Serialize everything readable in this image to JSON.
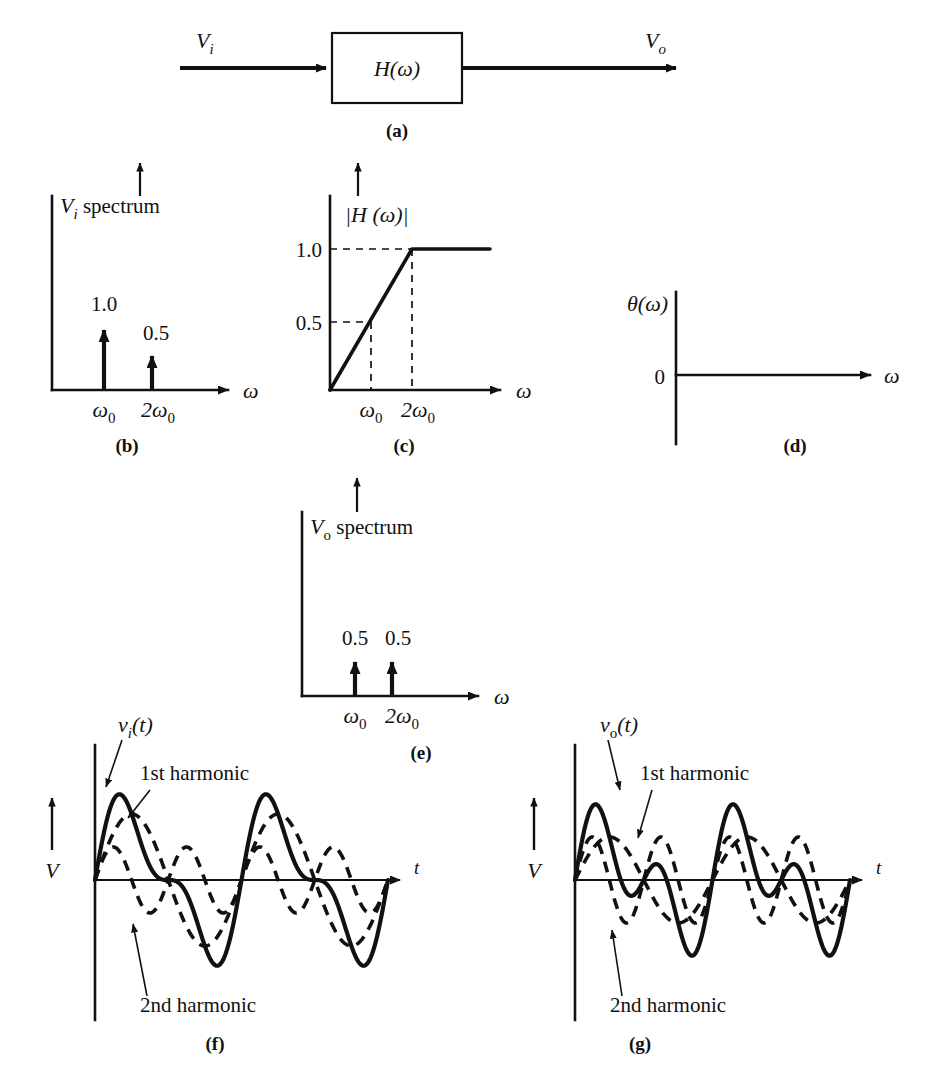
{
  "figure": {
    "panels": [
      {
        "id": "a",
        "label": "(a)",
        "caption": "block diagram"
      },
      {
        "id": "b",
        "label": "(b)",
        "caption": "input spectrum"
      },
      {
        "id": "c",
        "label": "(c)",
        "caption": "magnitude response"
      },
      {
        "id": "d",
        "label": "(d)",
        "caption": "phase response"
      },
      {
        "id": "e",
        "label": "(e)",
        "caption": "output spectrum"
      },
      {
        "id": "f",
        "label": "(f)",
        "caption": "input waveform"
      },
      {
        "id": "g",
        "label": "(g)",
        "caption": "output waveform"
      }
    ]
  },
  "panel_a": {
    "label": "(a)",
    "input_label": "V",
    "input_sub": "i",
    "output_label": "V",
    "output_sub": "o",
    "block_text": "H(ω)"
  },
  "panel_b": {
    "label": "(b)",
    "axis_title": "spectrum",
    "axis_title_var": "V",
    "axis_title_sub": "i",
    "x_axis_label": "ω",
    "tick_labels": [
      "ω",
      "2ω"
    ],
    "tick_sub": "0",
    "value_labels": [
      "1.0",
      "0.5"
    ],
    "chart_data": {
      "type": "bar",
      "title": "Vi spectrum",
      "categories": [
        "ω0",
        "2ω0"
      ],
      "values": [
        1.0,
        0.5
      ],
      "xlabel": "ω",
      "ylabel": "",
      "ylim": [
        0,
        1.25
      ],
      "grid": false,
      "legend": "none"
    }
  },
  "panel_c": {
    "label": "(c)",
    "axis_title": "|H (ω)|",
    "x_axis_label": "ω",
    "y_tick_labels": [
      "1.0",
      "0.5"
    ],
    "x_tick_labels": [
      "ω",
      "2ω"
    ],
    "x_tick_sub": "0",
    "chart_data": {
      "type": "line",
      "title": "|H (ω)|",
      "x": [
        0,
        1,
        2,
        4
      ],
      "y": [
        0.0,
        0.5,
        1.0,
        1.0
      ],
      "x_tick_values": [
        1,
        2
      ],
      "x_tick_labels": [
        "ω0",
        "2ω0"
      ],
      "y_tick_values": [
        0.5,
        1.0
      ],
      "y_tick_labels": [
        "0.5",
        "1.0"
      ],
      "xlabel": "ω",
      "ylabel": "",
      "ylim": [
        0,
        1.25
      ],
      "grid": false,
      "guides": "dashed",
      "legend": "none"
    }
  },
  "panel_d": {
    "label": "(d)",
    "axis_title": "θ(ω)",
    "zero_label": "0",
    "x_axis_label": "ω",
    "chart_data": {
      "type": "line",
      "title": "θ(ω)",
      "x": [
        0,
        4
      ],
      "y": [
        0,
        0
      ],
      "xlabel": "ω",
      "ylabel": "θ(ω)",
      "y_tick_values": [
        0
      ],
      "y_tick_labels": [
        "0"
      ],
      "grid": false,
      "legend": "none"
    }
  },
  "panel_e": {
    "label": "(e)",
    "axis_title": "spectrum",
    "axis_title_var": "V",
    "axis_title_sub": "o",
    "x_axis_label": "ω",
    "tick_labels": [
      "ω",
      "2ω"
    ],
    "tick_sub": "0",
    "value_labels": [
      "0.5",
      "0.5"
    ],
    "chart_data": {
      "type": "bar",
      "title": "Vo spectrum",
      "categories": [
        "ω0",
        "2ω0"
      ],
      "values": [
        0.5,
        0.5
      ],
      "xlabel": "ω",
      "ylabel": "",
      "ylim": [
        0,
        1.25
      ],
      "grid": false,
      "legend": "none"
    }
  },
  "panel_f": {
    "label": "(f)",
    "signal_label": "v",
    "signal_sub": "i",
    "signal_suffix": "(t)",
    "y_axis_label": "V",
    "x_axis_label": "t",
    "ann_first": "1st harmonic",
    "ann_second": "2nd harmonic",
    "chart_data": {
      "type": "line",
      "title": "vi(t)",
      "xlabel": "t",
      "ylabel": "V",
      "cycles": 2,
      "series": [
        {
          "name": "vi(t)",
          "style": "solid",
          "amplitude_1": 1.0,
          "amplitude_2": 0.5,
          "description": "sum of 1st and 2nd harmonics"
        },
        {
          "name": "1st harmonic",
          "style": "dashed",
          "amplitude": 1.0,
          "harmonic": 1
        },
        {
          "name": "2nd harmonic",
          "style": "dashed",
          "amplitude": 0.5,
          "harmonic": 2
        }
      ],
      "legend": "annotations"
    }
  },
  "panel_g": {
    "label": "(g)",
    "signal_label": "v",
    "signal_sub": "o",
    "signal_suffix": "(t)",
    "y_axis_label": "V",
    "x_axis_label": "t",
    "ann_first": "1st harmonic",
    "ann_second": "2nd harmonic",
    "chart_data": {
      "type": "line",
      "title": "vo(t)",
      "xlabel": "t",
      "ylabel": "V",
      "cycles": 2,
      "series": [
        {
          "name": "vo(t)",
          "style": "solid",
          "amplitude_1": 0.5,
          "amplitude_2": 0.5,
          "description": "sum of 1st and 2nd harmonics"
        },
        {
          "name": "1st harmonic",
          "style": "dashed",
          "amplitude": 0.5,
          "harmonic": 1
        },
        {
          "name": "2nd harmonic",
          "style": "dashed",
          "amplitude": 0.5,
          "harmonic": 2
        }
      ],
      "legend": "annotations"
    }
  },
  "colors": {
    "ink": "#111111",
    "paper": "#ffffff"
  }
}
